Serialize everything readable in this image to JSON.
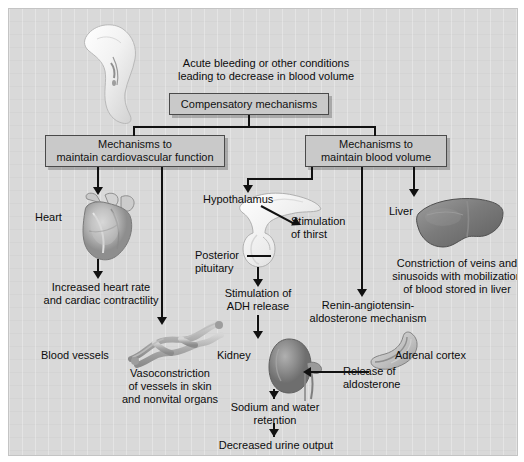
{
  "figure": {
    "title_text": "Acute bleeding or other conditions\nleading to decrease in blood volume",
    "background_color": "#d9d9d9",
    "box_fill_color": "#c9c9c9",
    "line_color": "#111111"
  },
  "boxes": {
    "compensatory": "Compensatory mechanisms",
    "cardiovascular": "Mechanisms to\nmaintain cardiovascular function",
    "blood_volume": "Mechanisms to\nmaintain blood volume"
  },
  "labels": {
    "heart": "Heart",
    "heart_effect": "Increased heart rate\nand cardiac contractility",
    "blood_vessels": "Blood vessels",
    "vasoconstriction": "Vasoconstriction\nof vessels in skin\nand nonvital organs",
    "hypothalamus": "Hypothalamus",
    "thirst": "Stimulation\nof thirst",
    "posterior_pituitary": "Posterior\npituitary",
    "adh": "Stimulation of\nADH release",
    "kidney": "Kidney",
    "sodium_water": "Sodium and water\nretention",
    "urine": "Decreased urine output",
    "liver": "Liver",
    "liver_effect": "Constriction of veins and\nsinusoids with mobilization\nof blood stored in liver",
    "renin": "Renin-angiotensin-\naldosterone mechanism",
    "adrenal_cortex": "Adrenal cortex",
    "aldosterone": "Release of\naldosterone"
  },
  "illustrations": {
    "leg": "wounded-leg-illustration",
    "heart": "heart-illustration",
    "vessels": "blood-vessels-illustration",
    "pituitary": "hypothalamus-pituitary-illustration",
    "kidney": "kidney-illustration",
    "liver": "liver-illustration",
    "adrenal": "adrenal-cortex-illustration"
  }
}
